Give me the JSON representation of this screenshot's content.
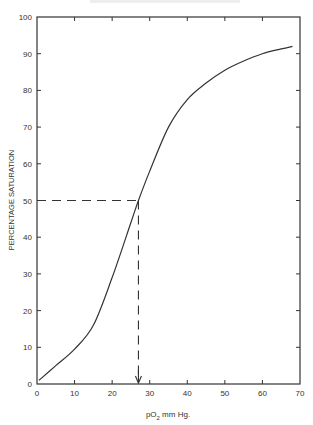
{
  "chart_data": {
    "type": "line",
    "title": "",
    "xlabel": "pO2 mm Hg.",
    "xlabel_main": "pO",
    "xlabel_sub": "2",
    "xlabel_unit": " mm  Hg.",
    "ylabel": "PERCENTAGE SATURATION",
    "xlim": [
      0,
      70
    ],
    "ylim": [
      0,
      100
    ],
    "x_ticks": [
      0,
      10,
      20,
      30,
      40,
      50,
      60,
      70
    ],
    "y_ticks": [
      0,
      10,
      20,
      30,
      40,
      50,
      60,
      70,
      80,
      90,
      100
    ],
    "grid": false,
    "legend": null,
    "series": [
      {
        "name": "Oxygen dissociation curve",
        "x": [
          0.5,
          5,
          10,
          15,
          20,
          25,
          27,
          30,
          35,
          40,
          45,
          50,
          55,
          60,
          65,
          68
        ],
        "y": [
          1,
          5,
          9.5,
          16,
          29,
          44,
          50,
          58,
          70,
          77.5,
          82,
          85.5,
          88,
          90,
          91.3,
          92
        ]
      }
    ],
    "annotations": [
      {
        "type": "dashed-horizontal",
        "y": 50,
        "x_from": 0,
        "x_to": 27
      },
      {
        "type": "dashed-vertical-arrow",
        "x": 27,
        "y_from": 50,
        "y_to": 0
      }
    ]
  },
  "colors": {
    "ink": "#333333",
    "background": "#ffffff"
  }
}
